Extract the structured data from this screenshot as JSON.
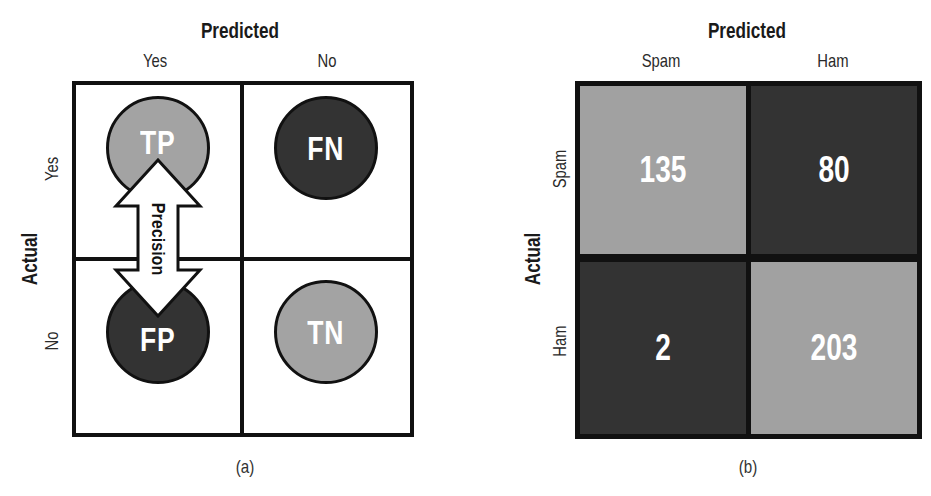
{
  "panel_a": {
    "title": "Predicted",
    "column_labels": [
      "Yes",
      "No"
    ],
    "row_axis_title": "Actual",
    "row_labels": [
      "Yes",
      "No"
    ],
    "cells": [
      {
        "label": "TP",
        "shade": "light"
      },
      {
        "label": "FN",
        "shade": "dark"
      },
      {
        "label": "FP",
        "shade": "dark"
      },
      {
        "label": "TN",
        "shade": "light"
      }
    ],
    "arrow_label": "Precision",
    "caption": "(a)"
  },
  "panel_b": {
    "title": "Predicted",
    "column_labels": [
      "Spam",
      "Ham"
    ],
    "row_axis_title": "Actual",
    "row_labels": [
      "Spam",
      "Ham"
    ],
    "cells": [
      {
        "value": "135",
        "shade": "light"
      },
      {
        "value": "80",
        "shade": "dark"
      },
      {
        "value": "2",
        "shade": "dark"
      },
      {
        "value": "203",
        "shade": "light"
      }
    ],
    "caption": "(b)"
  },
  "colors": {
    "light": "#a3a3a3",
    "dark": "#333333",
    "border": "#111111",
    "text_on_cell": "#ffffff"
  }
}
